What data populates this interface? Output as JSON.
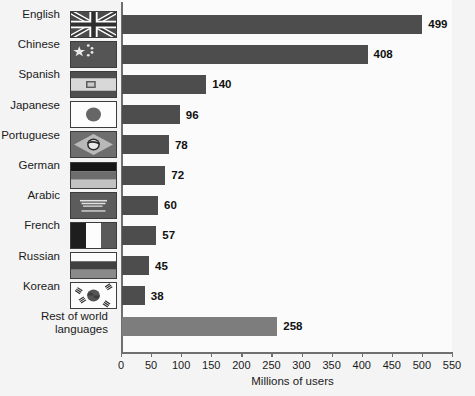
{
  "chart_data": {
    "type": "bar",
    "orientation": "horizontal",
    "title": "",
    "xlabel": "Millions of users",
    "ylabel": "",
    "xlim": [
      0,
      550
    ],
    "xticks": [
      0,
      50,
      100,
      150,
      200,
      250,
      300,
      350,
      400,
      450,
      500,
      550
    ],
    "grid": false,
    "legend": null,
    "categories": [
      "English",
      "Chinese",
      "Spanish",
      "Japanese",
      "Portuguese",
      "German",
      "Arabic",
      "French",
      "Russian",
      "Korean",
      "Rest of world\nlanguages"
    ],
    "values": [
      499,
      408,
      140,
      96,
      78,
      72,
      60,
      57,
      45,
      38,
      258
    ],
    "bar_colors": [
      "#4d4d4d",
      "#4d4d4d",
      "#4d4d4d",
      "#4d4d4d",
      "#4d4d4d",
      "#4d4d4d",
      "#4d4d4d",
      "#4d4d4d",
      "#4d4d4d",
      "#4d4d4d",
      "#7d7d7d"
    ],
    "flags": [
      "flag-united-kingdom",
      "flag-china",
      "flag-spain",
      "flag-japan",
      "flag-brazil",
      "flag-germany",
      "flag-saudi-arabia",
      "flag-france",
      "flag-russia",
      "flag-south-korea",
      ""
    ]
  },
  "colors": {
    "background": "#f4f4f4",
    "plot_background": "#fbfbfb",
    "axis": "#6f6f6f",
    "bar_primary": "#4d4d4d",
    "bar_secondary": "#7d7d7d",
    "text": "#1a1a1a"
  }
}
